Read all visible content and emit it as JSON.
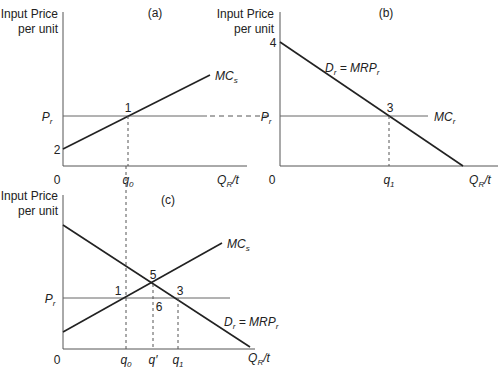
{
  "panels": {
    "a": {
      "title": "(a)",
      "ylabel_line1": "Input Price",
      "ylabel_line2": "per unit",
      "origin": "0",
      "price_label": "P",
      "price_sub": "r",
      "intercept": "2",
      "curve_label": "MC",
      "curve_sub": "s",
      "point": "1",
      "q_label": "q",
      "q_sub": "0",
      "xlabel": "Q",
      "xlabel_sub": "R",
      "xlabel_tail": "/t"
    },
    "b": {
      "title": "(b)",
      "ylabel_line1": "Input Price",
      "ylabel_line2": "per unit",
      "origin": "0",
      "intercept": "4",
      "price_label": "P",
      "price_sub": "r",
      "demand_label_D": "D",
      "demand_sub": "r",
      "demand_eq": " = MRP",
      "demand_eq_sub": "r",
      "mc_label": "MC",
      "mc_sub": "r",
      "point": "3",
      "q_label": "q",
      "q_sub": "1",
      "xlabel": "Q",
      "xlabel_sub": "R",
      "xlabel_tail": "/t"
    },
    "c": {
      "title": "(c)",
      "ylabel_line1": "Input Price",
      "ylabel_line2": "per unit",
      "origin": "0",
      "price_label": "P",
      "price_sub": "r",
      "mc_label": "MC",
      "mc_sub": "s",
      "demand_label_D": "D",
      "demand_sub": "r",
      "demand_eq": " = MRP",
      "demand_eq_sub": "r",
      "points": [
        "1",
        "5",
        "3",
        "6"
      ],
      "q0_label": "q",
      "q0_sub": "0",
      "qprime_label": "q′",
      "q1_label": "q",
      "q1_sub": "1",
      "xlabel": "Q",
      "xlabel_sub": "R",
      "xlabel_tail": "/t"
    }
  }
}
